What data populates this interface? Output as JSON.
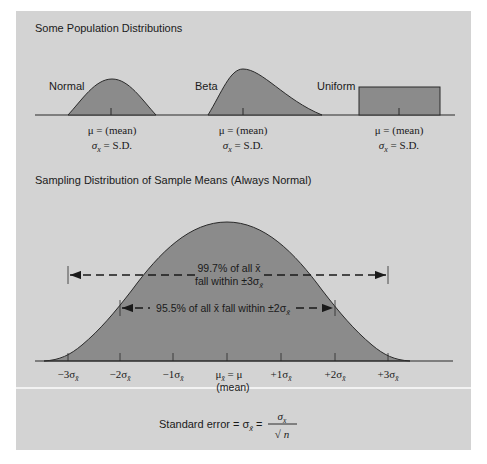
{
  "colors": {
    "background": "#d3d3d3",
    "fill": "#8b8b8b",
    "line": "#2a2a2a",
    "divider": "#f2f2f2"
  },
  "top_section": {
    "title": "Some Population Distributions",
    "distributions": [
      {
        "name": "Normal",
        "mean_label": "μ = (mean)",
        "sd_label_symbol": "σ",
        "sd_label_sub": "x",
        "sd_label_rest": " = S.D."
      },
      {
        "name": "Beta",
        "mean_label": "μ = (mean)",
        "sd_label_symbol": "σ",
        "sd_label_sub": "x",
        "sd_label_rest": " = S.D."
      },
      {
        "name": "Uniform",
        "mean_label": "μ = (mean)",
        "sd_label_symbol": "σ",
        "sd_label_sub": "x",
        "sd_label_rest": " = S.D."
      }
    ]
  },
  "bottom_section": {
    "title": "Sampling Distribution of Sample Means (Always Normal)",
    "range_997": {
      "line1": "99.7% of all x̄",
      "line2_pre": "fall within ±3σ",
      "line2_sub": "x̄"
    },
    "range_955": {
      "pre": "95.5% of all x̄ fall within ±2σ",
      "sub": "x̄"
    },
    "ticks": [
      {
        "label": "−3σ",
        "sub": "x̄"
      },
      {
        "label": "−2σ",
        "sub": "x̄"
      },
      {
        "label": "−1σ",
        "sub": "x̄"
      },
      {
        "label": "μ",
        "sub": "x̄",
        "rest": " = μ",
        "note": "(mean)"
      },
      {
        "label": "+1σ",
        "sub": "x̄"
      },
      {
        "label": "+2σ",
        "sub": "x̄"
      },
      {
        "label": "+3σ",
        "sub": "x̄"
      }
    ]
  },
  "formula": {
    "prefix": "Standard error = σ",
    "sub": "x̄",
    "equals": " = ",
    "numerator_symbol": "σ",
    "numerator_sub": "x",
    "denominator": "√ n"
  }
}
